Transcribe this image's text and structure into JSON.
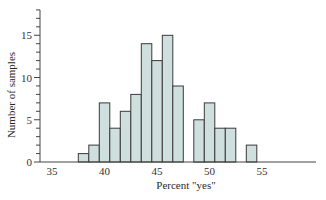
{
  "chart_data": {
    "type": "bar",
    "subtype": "histogram",
    "title": "",
    "xlabel": "Percent \"yes\"",
    "ylabel": "Number of samples",
    "xlim": [
      34.5,
      60
    ],
    "ylim": [
      0,
      18
    ],
    "x_ticks": [
      35,
      40,
      45,
      50,
      55
    ],
    "y_ticks": [
      0,
      5,
      10,
      15
    ],
    "y_minor_tick_step": 1,
    "bin_width": 1,
    "grid": false,
    "legend": null,
    "bar_color": "#cfdfdd",
    "bar_edge_color": "#3a3a3a",
    "bins": [
      {
        "x_start": 37.5,
        "x_end": 38.5,
        "center": 38,
        "count": 1
      },
      {
        "x_start": 38.5,
        "x_end": 39.5,
        "center": 39,
        "count": 2
      },
      {
        "x_start": 39.5,
        "x_end": 40.5,
        "center": 40,
        "count": 7
      },
      {
        "x_start": 40.5,
        "x_end": 41.5,
        "center": 41,
        "count": 4
      },
      {
        "x_start": 41.5,
        "x_end": 42.5,
        "center": 42,
        "count": 6
      },
      {
        "x_start": 42.5,
        "x_end": 43.5,
        "center": 43,
        "count": 8
      },
      {
        "x_start": 43.5,
        "x_end": 44.5,
        "center": 44,
        "count": 14
      },
      {
        "x_start": 44.5,
        "x_end": 45.5,
        "center": 45,
        "count": 12
      },
      {
        "x_start": 45.5,
        "x_end": 46.5,
        "center": 46,
        "count": 15
      },
      {
        "x_start": 46.5,
        "x_end": 47.5,
        "center": 47,
        "count": 9
      },
      {
        "x_start": 47.5,
        "x_end": 48.5,
        "center": 48,
        "count": 0
      },
      {
        "x_start": 48.5,
        "x_end": 49.5,
        "center": 49,
        "count": 5
      },
      {
        "x_start": 49.5,
        "x_end": 50.5,
        "center": 50,
        "count": 7
      },
      {
        "x_start": 50.5,
        "x_end": 51.5,
        "center": 51,
        "count": 4
      },
      {
        "x_start": 51.5,
        "x_end": 52.5,
        "center": 52,
        "count": 4
      },
      {
        "x_start": 52.5,
        "x_end": 53.5,
        "center": 53,
        "count": 0
      },
      {
        "x_start": 53.5,
        "x_end": 54.5,
        "center": 54,
        "count": 2
      }
    ],
    "categories": [
      38,
      39,
      40,
      41,
      42,
      43,
      44,
      45,
      46,
      47,
      48,
      49,
      50,
      51,
      52,
      53,
      54
    ],
    "values": [
      1,
      2,
      7,
      4,
      6,
      8,
      14,
      12,
      15,
      9,
      0,
      5,
      7,
      4,
      4,
      0,
      2
    ]
  }
}
